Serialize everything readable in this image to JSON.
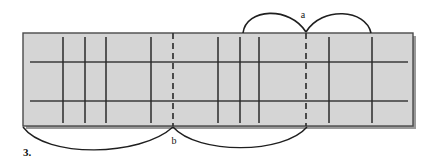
{
  "figure": {
    "caption": "3.",
    "type": "technical-line-diagram",
    "colors": {
      "background": "#ffffff",
      "panel_fill": "#d5d5d5",
      "panel_border": "#4a4a4a",
      "line": "#2a2a2a",
      "thin_line": "#3d3d3d",
      "dash_line": "#333333",
      "arc": "#1f1f1f",
      "shadow": "#9a9a9a",
      "text": "#151515"
    },
    "labels": [
      {
        "id": "a",
        "text": "a",
        "x": 306,
        "y": 14,
        "position": "above-panel"
      },
      {
        "id": "b",
        "text": "b",
        "x": 174,
        "y": 141,
        "position": "below-panel"
      }
    ],
    "panel": {
      "x": 23,
      "y": 33,
      "width": 390,
      "height": 93
    },
    "horizontal_lines": [
      {
        "id": "upper-rule",
        "y": 62,
        "x1": 30,
        "x2": 408
      },
      {
        "id": "lower-rule",
        "y": 101,
        "x1": 30,
        "x2": 408
      }
    ],
    "vertical_lines": [
      {
        "id": "v1",
        "x": 63,
        "y1": 37,
        "y2": 123,
        "style": "solid"
      },
      {
        "id": "v2",
        "x": 85,
        "y1": 37,
        "y2": 123,
        "style": "solid"
      },
      {
        "id": "v3",
        "x": 106,
        "y1": 37,
        "y2": 123,
        "style": "solid"
      },
      {
        "id": "v4",
        "x": 151,
        "y1": 37,
        "y2": 123,
        "style": "solid"
      },
      {
        "id": "v5",
        "x": 173,
        "y1": 33,
        "y2": 126,
        "style": "dashed"
      },
      {
        "id": "v6",
        "x": 218,
        "y1": 37,
        "y2": 123,
        "style": "solid"
      },
      {
        "id": "v7",
        "x": 240,
        "y1": 37,
        "y2": 123,
        "style": "solid"
      },
      {
        "id": "v8",
        "x": 259,
        "y1": 37,
        "y2": 123,
        "style": "solid"
      },
      {
        "id": "v9",
        "x": 306,
        "y1": 33,
        "y2": 126,
        "style": "dashed"
      },
      {
        "id": "v10",
        "x": 329,
        "y1": 37,
        "y2": 123,
        "style": "solid"
      },
      {
        "id": "v11",
        "x": 372,
        "y1": 37,
        "y2": 123,
        "style": "solid"
      }
    ],
    "arcs": [
      {
        "id": "arc-top-left",
        "x1": 243,
        "x2": 306,
        "apex_y": 9,
        "side": "above"
      },
      {
        "id": "arc-top-right",
        "x1": 306,
        "x2": 371,
        "apex_y": 9,
        "side": "above"
      },
      {
        "id": "arc-bottom-left",
        "x1": 23,
        "x2": 173,
        "apex_y": 155,
        "side": "below"
      },
      {
        "id": "arc-bottom-right",
        "x1": 173,
        "x2": 307,
        "apex_y": 153,
        "side": "below"
      }
    ]
  }
}
